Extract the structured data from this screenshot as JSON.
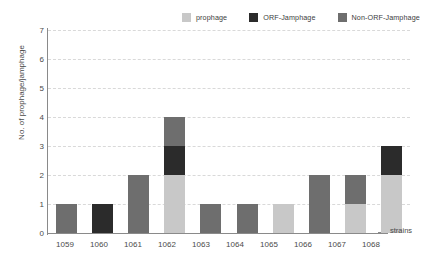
{
  "chart_data": {
    "type": "bar",
    "stacked": true,
    "title": "",
    "xlabel": "strains",
    "ylabel": "No. of prophage/jamphage",
    "categories": [
      "1059",
      "1060",
      "1061",
      "1062",
      "1063",
      "1064",
      "1065",
      "1066",
      "1067",
      "1068"
    ],
    "ylim": [
      0,
      7
    ],
    "yticks": [
      "7",
      "6",
      "5",
      "4",
      "3",
      "2",
      "1",
      "0"
    ],
    "grid": true,
    "legend_position": "top-right",
    "series": [
      {
        "name": "prophage",
        "color": "#c8c8c8",
        "values": [
          0,
          0,
          0,
          2,
          0,
          0,
          1,
          0,
          1,
          2
        ]
      },
      {
        "name": "ORF-Jamphage",
        "color": "#2b2b2b",
        "values": [
          0,
          1,
          0,
          1,
          0,
          0,
          0,
          0,
          0,
          1
        ]
      },
      {
        "name": "Non-ORF-Jamphage",
        "color": "#6e6e6e",
        "values": [
          1,
          0,
          2,
          1,
          1,
          1,
          0,
          2,
          1,
          0
        ]
      }
    ],
    "totals": [
      1,
      1,
      2,
      4,
      1,
      1,
      1,
      2,
      2,
      3
    ]
  },
  "axis_annotation": {
    "strains_label": "strains"
  },
  "colors": {
    "grid": "#d9d9d9",
    "axis": "#8a8a8a",
    "text": "#4a4a4a",
    "background": "#ffffff"
  }
}
